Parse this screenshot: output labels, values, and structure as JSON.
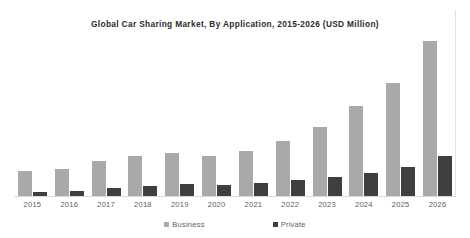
{
  "chart_data": {
    "type": "bar",
    "title": "Global  Car  Sharing  Market, By  Application,   2015-2026 (USD Million)",
    "xlabel": "",
    "ylabel": "",
    "ylim": [
      0,
      6000
    ],
    "grid": false,
    "legend_position": "bottom",
    "categories": [
      "2015",
      "2016",
      "2017",
      "2018",
      "2019",
      "2020",
      "2021",
      "2022",
      "2023",
      "2024",
      "2025",
      "2026"
    ],
    "series": [
      {
        "name": "Business",
        "color": "#a9a9a9",
        "values": [
          800,
          880,
          1140,
          1300,
          1400,
          1300,
          1460,
          1780,
          2240,
          2900,
          3660,
          5000
        ]
      },
      {
        "name": "Private",
        "color": "#3f3f3f",
        "values": [
          140,
          170,
          250,
          320,
          380,
          370,
          420,
          530,
          620,
          740,
          940,
          1300
        ]
      }
    ],
    "axis_color": "#d9d9d9",
    "frame_color": "#e2e2e2"
  },
  "legend": {
    "items": [
      {
        "label": "Business"
      },
      {
        "label": "Private"
      }
    ]
  }
}
